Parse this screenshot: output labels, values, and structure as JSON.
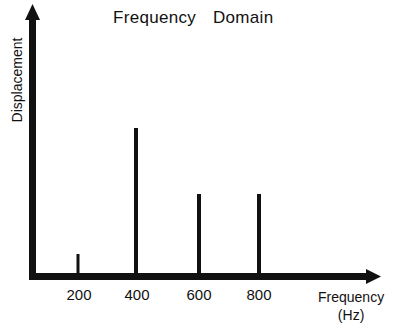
{
  "chart_data": {
    "type": "bar",
    "title": "Frequency Domain",
    "xlabel": "Frequency",
    "xlabel_unit": "(Hz)",
    "ylabel": "Displacement",
    "categories": [
      "200",
      "400",
      "600",
      "800"
    ],
    "x": [
      200,
      400,
      600,
      800
    ],
    "values": [
      23,
      149,
      83,
      83
    ],
    "value_units": "relative amplitude (unlabeled axis)",
    "ylim": [
      0,
      272
    ],
    "grid": false,
    "legend": null,
    "style": "spectral line (stem) plot, black thick axes with arrowheads"
  },
  "colors": {
    "ink": "#111111",
    "background": "#ffffff"
  }
}
